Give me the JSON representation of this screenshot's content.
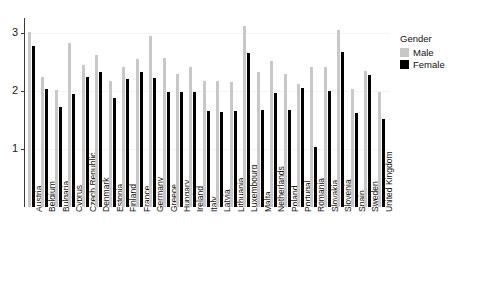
{
  "chart_data": {
    "type": "bar",
    "title": "",
    "subtitle": "",
    "xlabel": "",
    "ylabel": "",
    "ylim": [
      0,
      3.2
    ],
    "yticks": [
      1,
      2,
      3
    ],
    "ytick_labels": [
      "1",
      "2",
      "3"
    ],
    "grid": true,
    "orientation": "vertical",
    "grouping": "grouped",
    "legend": {
      "title": "Gender",
      "position": "right",
      "entries": [
        {
          "name": "Male",
          "color": "#c8c8c8"
        },
        {
          "name": "Female",
          "color": "#000000"
        }
      ]
    },
    "categories": [
      "Austria",
      "Belgium",
      "Bulgaria",
      "Cyprus",
      "Czech Republic",
      "Denmark",
      "Estonia",
      "Finland",
      "France",
      "Germany",
      "Greece",
      "Hungary",
      "Ireland",
      "Italy",
      "Latvia",
      "Lithuania",
      "Luxembourg",
      "Malta",
      "Netherlands",
      "Poland",
      "Portugal",
      "Romania",
      "Slovakia",
      "Slovenia",
      "Spain",
      "Sweden",
      "United Kingdom"
    ],
    "series": [
      {
        "name": "Male",
        "color": "#c8c8c8",
        "values": [
          3.02,
          2.25,
          2.02,
          2.83,
          2.45,
          2.62,
          2.18,
          2.42,
          2.55,
          2.95,
          2.57,
          2.3,
          2.42,
          2.18,
          2.17,
          2.15,
          3.12,
          2.33,
          2.52,
          2.3,
          2.12,
          2.42,
          2.42,
          3.05,
          2.03,
          2.35,
          1.98
        ]
      },
      {
        "name": "Female",
        "color": "#000000",
        "values": [
          2.78,
          2.03,
          1.72,
          1.95,
          2.25,
          2.32,
          1.88,
          2.2,
          2.32,
          2.22,
          1.98,
          1.98,
          1.98,
          1.65,
          1.63,
          1.65,
          2.65,
          1.67,
          1.97,
          1.67,
          2.05,
          1.03,
          2.0,
          2.68,
          1.62,
          2.27,
          1.52
        ]
      }
    ]
  }
}
